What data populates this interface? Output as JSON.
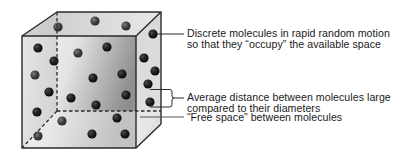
{
  "cube": {
    "front_face": {
      "x1": 22,
      "y1": 36,
      "x2": 136,
      "y2": 148
    },
    "back_offset": {
      "dx": 35,
      "dy": -24
    },
    "edge_color": "#2a2a2a",
    "hidden_edge_style": "dashed",
    "face_colors": {
      "front_light": "#f2f2f2",
      "front_dark": "#9c9c9c",
      "top": "#dcdcdc",
      "side": "#d4d4d4",
      "left_inner": "#c9c9c9",
      "bottom_inner": "#e6e6e6"
    }
  },
  "molecules": {
    "color_dark": "#111111",
    "color_light": "#7a7a7a",
    "radius": 4.6,
    "front": [
      [
        38,
        48
      ],
      [
        78,
        53
      ],
      [
        107,
        47
      ],
      [
        54,
        61
      ],
      [
        35,
        75
      ],
      [
        93,
        78
      ],
      [
        122,
        74
      ],
      [
        49,
        92
      ],
      [
        71,
        98
      ],
      [
        96,
        105
      ],
      [
        126,
        95
      ],
      [
        37,
        112
      ],
      [
        62,
        121
      ],
      [
        117,
        118
      ],
      [
        38,
        136
      ],
      [
        92,
        134
      ],
      [
        125,
        134
      ]
    ],
    "top": [
      [
        58,
        27
      ],
      [
        95,
        21
      ],
      [
        126,
        26
      ]
    ],
    "side": [
      [
        153,
        34
      ],
      [
        144,
        58
      ],
      [
        155,
        71
      ],
      [
        148,
        84
      ],
      [
        150,
        102
      ]
    ]
  },
  "callouts": [
    {
      "id": "discrete-molecules",
      "lines": [
        "Discrete molecules in rapid random motion",
        "so that they “occupy” the available space"
      ],
      "x": 187,
      "y": 27
    },
    {
      "id": "average-distance",
      "lines": [
        "Average distance between molecules large",
        "compared to their diameters"
      ],
      "x": 187,
      "y": 91
    },
    {
      "id": "free-space",
      "lines": [
        "“Free space” between molecules"
      ],
      "x": 187,
      "y": 112
    }
  ]
}
